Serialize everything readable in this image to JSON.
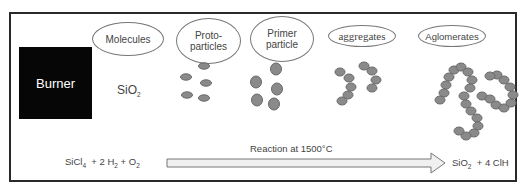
{
  "burner": {
    "label": "Burner",
    "color": "#060606"
  },
  "stages": [
    {
      "label": "Molecules"
    },
    {
      "label_line1": "Proto-",
      "label_line2": "particles"
    },
    {
      "label_line1": "Primer",
      "label_line2": "particle"
    },
    {
      "label": "aggregates"
    },
    {
      "label": "Aglomerates"
    }
  ],
  "molecule_formula": {
    "base": "SiO",
    "sub": "2"
  },
  "reaction": {
    "reactants": {
      "a": "SiCl",
      "a_sub": "4",
      "b": "+ 2 H",
      "b_sub": "2",
      "c": "+ O",
      "c_sub": "2"
    },
    "arrow_label": "Reaction at 1500°C",
    "products": {
      "a": "SiO",
      "a_sub": "2",
      "b": "+ 4 ClH"
    }
  },
  "colors": {
    "particle_fill": "#8a8a8a",
    "particle_stroke": "#6a6a6a",
    "border": "#2a2a2a"
  }
}
